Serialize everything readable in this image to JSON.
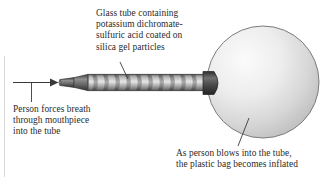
{
  "figure": {
    "name": "breath-alcohol-tester-diagram",
    "background": "#ffffff",
    "edge_rule_color": "#d8d8d8"
  },
  "captions": {
    "glass_tube": "Glass tube containing\npotassium dichromate-\nsulfuric acid coated on\nsilica gel particles",
    "person_breath": "Person forces breath\nthrough mouthpiece\ninto the tube",
    "bag_inflates": "As person blows into the tube,\nthe plastic bag becomes inflated"
  },
  "parts": {
    "mouthpiece_label": "mouthpiece",
    "tube_label": "glass tube",
    "connector_label": "tube-to-bag connector",
    "bag_label": "plastic bag",
    "arrow_label": "breath flow arrow"
  },
  "colors": {
    "text": "#2b2b2b",
    "line": "#3a3a3a",
    "tube_dark": "#4a4a4a",
    "tube_mid": "#8d8d8d",
    "tube_light": "#cfcfcf",
    "bag_light": "#f2f2f2",
    "bag_mid": "#d2d2d2",
    "bag_edge": "#7c7c7c"
  }
}
